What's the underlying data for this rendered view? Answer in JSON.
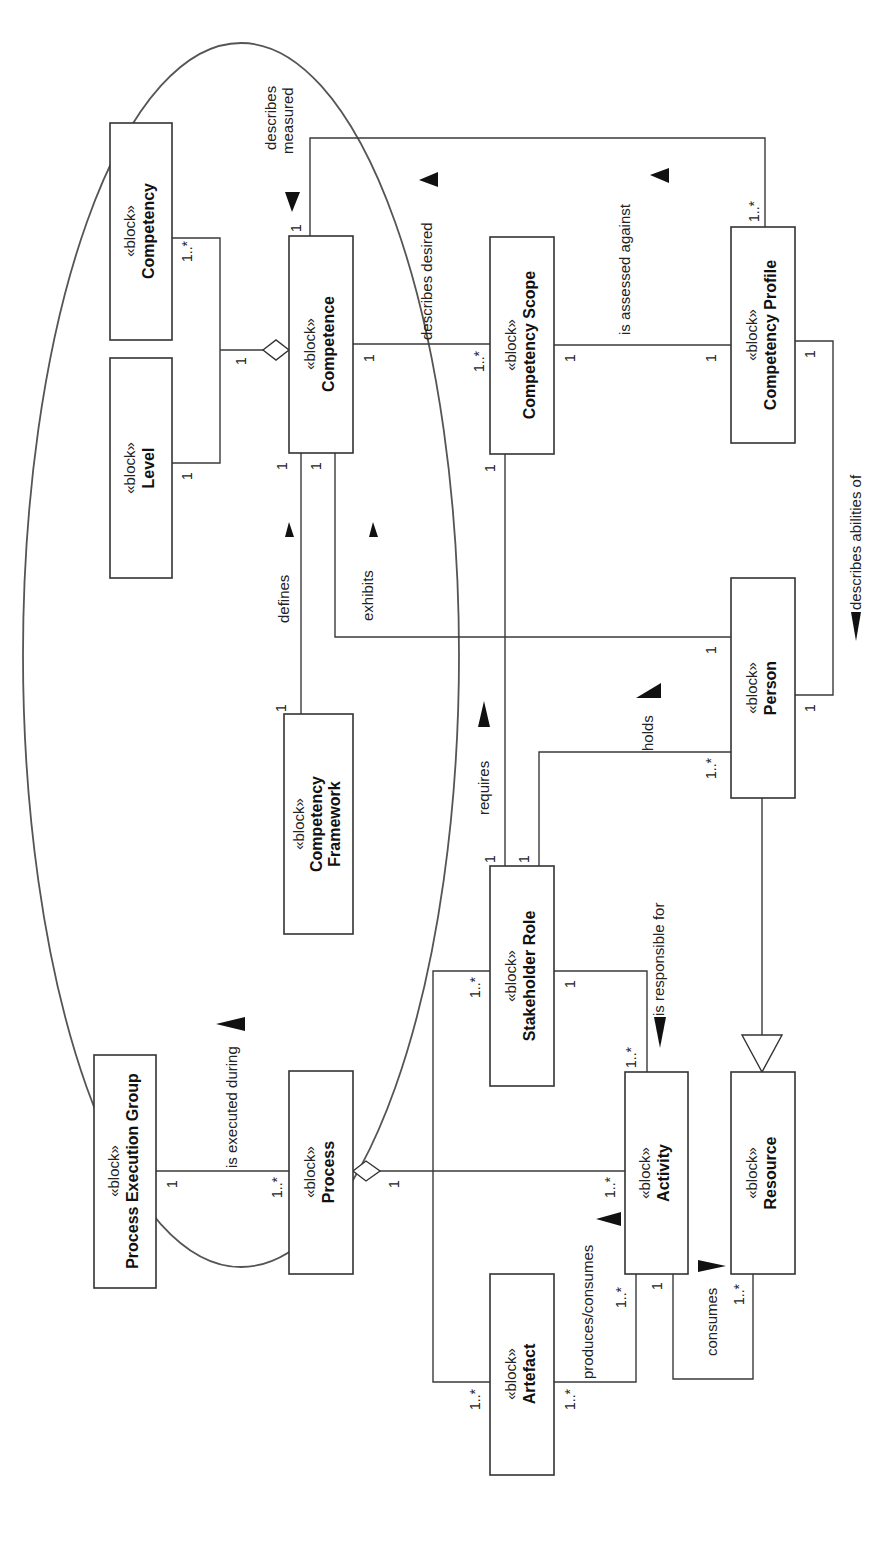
{
  "diagram": {
    "stereotype": "«block»",
    "blocks": {
      "competency": {
        "name": "Competency"
      },
      "level": {
        "name": "Level"
      },
      "competence": {
        "name": "Competence"
      },
      "competency_framework": {
        "name_line1": "Competency",
        "name_line2": "Framework"
      },
      "competency_scope": {
        "name": "Competency Scope"
      },
      "competency_profile": {
        "name": "Competency Profile"
      },
      "person": {
        "name": "Person"
      },
      "stakeholder_role": {
        "name": "Stakeholder Role"
      },
      "process_execution_group": {
        "name": "Process Execution Group"
      },
      "process": {
        "name": "Process"
      },
      "activity": {
        "name": "Activity"
      },
      "resource": {
        "name": "Resource"
      },
      "artefact": {
        "name": "Artefact"
      }
    },
    "associations": {
      "describes_measured": {
        "line1": "describes",
        "line2": "measured"
      },
      "describes_desired": "describes desired",
      "is_assessed_against": "is assessed against",
      "defines": "defines",
      "exhibits": "exhibits",
      "describes_abilities_of": "describes abilities of",
      "requires": "requires",
      "holds": "holds",
      "is_responsible_for": "is responsible for",
      "is_executed_during": "is executed during",
      "produces_consumes": "produces/consumes",
      "consumes": "consumes"
    },
    "multiplicities": {
      "one": "1",
      "one_many": "1..*"
    }
  }
}
